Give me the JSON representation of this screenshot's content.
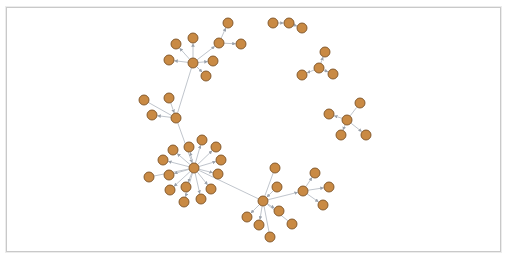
{
  "canvas": {
    "frame": {
      "x": 6,
      "y": 7,
      "width": 493,
      "height": 243
    },
    "colors": {
      "background": "#ffffff",
      "border": "#c9c9c9",
      "node_fill": "#c98a44",
      "node_stroke": "#7d5226",
      "edge": "#b9bec6",
      "arrow": "#9aa1ab"
    },
    "node_radius": 5
  },
  "graph": {
    "nodes": [
      {
        "id": "h1",
        "x": 193,
        "y": 63
      },
      {
        "id": "a1",
        "x": 219,
        "y": 43
      },
      {
        "id": "a2",
        "x": 228,
        "y": 23
      },
      {
        "id": "a3",
        "x": 241,
        "y": 44
      },
      {
        "id": "a4",
        "x": 193,
        "y": 38
      },
      {
        "id": "a5",
        "x": 176,
        "y": 44
      },
      {
        "id": "a6",
        "x": 169,
        "y": 60
      },
      {
        "id": "a7",
        "x": 213,
        "y": 61
      },
      {
        "id": "a8",
        "x": 206,
        "y": 76
      },
      {
        "id": "h2",
        "x": 176,
        "y": 118
      },
      {
        "id": "b1",
        "x": 144,
        "y": 100
      },
      {
        "id": "b2",
        "x": 169,
        "y": 98
      },
      {
        "id": "b3",
        "x": 152,
        "y": 115
      },
      {
        "id": "h3",
        "x": 194,
        "y": 168
      },
      {
        "id": "c1",
        "x": 202,
        "y": 140
      },
      {
        "id": "c2",
        "x": 216,
        "y": 147
      },
      {
        "id": "c3",
        "x": 189,
        "y": 147
      },
      {
        "id": "c4",
        "x": 173,
        "y": 150
      },
      {
        "id": "c5",
        "x": 221,
        "y": 160
      },
      {
        "id": "c6",
        "x": 163,
        "y": 160
      },
      {
        "id": "c7",
        "x": 149,
        "y": 177
      },
      {
        "id": "c8",
        "x": 169,
        "y": 175
      },
      {
        "id": "c9",
        "x": 218,
        "y": 174
      },
      {
        "id": "c10",
        "x": 170,
        "y": 190
      },
      {
        "id": "c11",
        "x": 186,
        "y": 187
      },
      {
        "id": "c12",
        "x": 211,
        "y": 189
      },
      {
        "id": "c13",
        "x": 184,
        "y": 202
      },
      {
        "id": "c14",
        "x": 201,
        "y": 199
      },
      {
        "id": "h4",
        "x": 263,
        "y": 201
      },
      {
        "id": "d1",
        "x": 275,
        "y": 168
      },
      {
        "id": "d2",
        "x": 277,
        "y": 187
      },
      {
        "id": "d3",
        "x": 279,
        "y": 211
      },
      {
        "id": "d4",
        "x": 247,
        "y": 217
      },
      {
        "id": "d5",
        "x": 259,
        "y": 225
      },
      {
        "id": "d6",
        "x": 292,
        "y": 224
      },
      {
        "id": "d7",
        "x": 270,
        "y": 237
      },
      {
        "id": "h5",
        "x": 303,
        "y": 191
      },
      {
        "id": "e1",
        "x": 315,
        "y": 173
      },
      {
        "id": "e2",
        "x": 329,
        "y": 187
      },
      {
        "id": "e3",
        "x": 323,
        "y": 205
      },
      {
        "id": "f1",
        "x": 273,
        "y": 23
      },
      {
        "id": "f2",
        "x": 289,
        "y": 23
      },
      {
        "id": "f3",
        "x": 302,
        "y": 28
      },
      {
        "id": "g0",
        "x": 319,
        "y": 68
      },
      {
        "id": "g1",
        "x": 325,
        "y": 52
      },
      {
        "id": "g2",
        "x": 302,
        "y": 75
      },
      {
        "id": "g3",
        "x": 333,
        "y": 74
      },
      {
        "id": "k0",
        "x": 347,
        "y": 120
      },
      {
        "id": "k1",
        "x": 360,
        "y": 103
      },
      {
        "id": "k2",
        "x": 329,
        "y": 114
      },
      {
        "id": "k3",
        "x": 341,
        "y": 135
      },
      {
        "id": "k4",
        "x": 366,
        "y": 135
      }
    ],
    "edges": [
      [
        "h1",
        "a1",
        true
      ],
      [
        "a1",
        "a2",
        true
      ],
      [
        "a1",
        "a3",
        true
      ],
      [
        "h1",
        "a4",
        true
      ],
      [
        "h1",
        "a5",
        true
      ],
      [
        "h1",
        "a6",
        true
      ],
      [
        "h1",
        "a7",
        true
      ],
      [
        "h1",
        "a8",
        true
      ],
      [
        "h1",
        "h2",
        false
      ],
      [
        "b1",
        "h2",
        false
      ],
      [
        "b2",
        "h2",
        true
      ],
      [
        "h2",
        "b3",
        true
      ],
      [
        "h2",
        "h3",
        true
      ],
      [
        "h3",
        "c1",
        true
      ],
      [
        "h3",
        "c2",
        true
      ],
      [
        "h3",
        "c3",
        true
      ],
      [
        "h3",
        "c4",
        true
      ],
      [
        "h3",
        "c5",
        true
      ],
      [
        "h3",
        "c6",
        true
      ],
      [
        "c7",
        "h3",
        false
      ],
      [
        "h3",
        "c8",
        true
      ],
      [
        "h3",
        "c9",
        true
      ],
      [
        "h3",
        "c10",
        true
      ],
      [
        "h3",
        "c11",
        true
      ],
      [
        "h3",
        "c12",
        true
      ],
      [
        "h3",
        "c13",
        true
      ],
      [
        "h3",
        "c14",
        true
      ],
      [
        "h3",
        "h4",
        false
      ],
      [
        "d1",
        "h4",
        false
      ],
      [
        "d2",
        "h4",
        true
      ],
      [
        "h4",
        "d3",
        true
      ],
      [
        "h4",
        "d4",
        true
      ],
      [
        "h4",
        "d5",
        true
      ],
      [
        "d6",
        "h4",
        false
      ],
      [
        "d7",
        "h4",
        false
      ],
      [
        "h4",
        "h5",
        true
      ],
      [
        "h5",
        "e1",
        true
      ],
      [
        "h5",
        "e2",
        true
      ],
      [
        "h5",
        "e3",
        true
      ],
      [
        "f1",
        "f2",
        true
      ],
      [
        "f2",
        "f3",
        true
      ],
      [
        "g0",
        "g1",
        true
      ],
      [
        "g0",
        "g2",
        true
      ],
      [
        "g0",
        "g3",
        true
      ],
      [
        "k0",
        "k1",
        false
      ],
      [
        "k0",
        "k2",
        true
      ],
      [
        "k0",
        "k3",
        true
      ],
      [
        "k0",
        "k4",
        true
      ]
    ]
  }
}
